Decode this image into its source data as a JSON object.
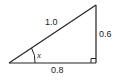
{
  "diagram": {
    "type": "right-triangle",
    "hypotenuse_label": "1.0",
    "vertical_side_label": "0.6",
    "horizontal_side_label": "0.8",
    "angle_label": "x",
    "stroke_color": "#222222",
    "background": "#ffffff"
  }
}
